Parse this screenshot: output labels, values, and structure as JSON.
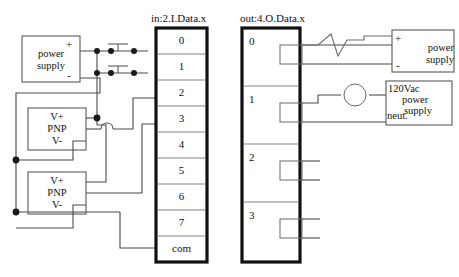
{
  "diagram": {
    "title_input": "in:2.I.Data.x",
    "title_output": "out:4.O.Data.x",
    "input_module": {
      "name": "input-terminal-block",
      "terminals": [
        "0",
        "1",
        "2",
        "3",
        "4",
        "5",
        "6",
        "7",
        "com"
      ]
    },
    "output_module": {
      "name": "output-terminal-block",
      "terminals": [
        "0",
        "1",
        "2",
        "3"
      ]
    },
    "left_power_supply": {
      "line1": "power",
      "line2": "supply",
      "plus": "+",
      "minus": "-"
    },
    "sensor_1": {
      "vplus": "V+",
      "type": "PNP",
      "vminus": "V-"
    },
    "sensor_2": {
      "vplus": "V+",
      "type": "PNP",
      "vminus": "V-"
    },
    "right_power_supply": {
      "line1": "power",
      "line2": "supply",
      "plus": "+",
      "minus": "-"
    },
    "ac_power_supply": {
      "line1": "120Vac",
      "line2": "power",
      "line3": "supply",
      "neutral": "neut."
    },
    "switches": [
      {
        "name": "pushbutton-switch-0",
        "row": "0"
      },
      {
        "name": "pushbutton-switch-1",
        "row": "1"
      }
    ],
    "loads": [
      {
        "name": "zigzag-load",
        "row": "0"
      },
      {
        "name": "lamp-load",
        "row": "1"
      }
    ],
    "colors": {
      "wire": "#4a4a4a",
      "block_border": "#111111",
      "box_border": "#5a5a5a",
      "background": "#ffffff",
      "text": "#111111"
    }
  }
}
